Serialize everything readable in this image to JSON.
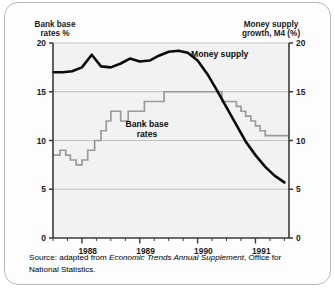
{
  "card": {
    "background_color": "#fdfdfd",
    "border_color": "#b9b9b9"
  },
  "axes": {
    "left_title_line1": "Bank base",
    "left_title_line2": "rates %",
    "right_title_line1": "Money supply",
    "right_title_line2": "growth, M4 (%)",
    "left_ticks": [
      "0",
      "5",
      "10",
      "15",
      "20"
    ],
    "right_ticks": [
      "0",
      "5",
      "10",
      "15",
      "20"
    ],
    "year_labels": [
      "1988",
      "1989",
      "1990",
      "1991"
    ]
  },
  "series_labels": {
    "money_supply": "Money supply",
    "bank_base_line1": "Bank base",
    "bank_base_line2": "rates"
  },
  "source": {
    "prefix": "Source: adapted from ",
    "italic_title": "Economic Trends Annual Supplement",
    "suffix": ", Office for",
    "line2": "National Statistics."
  },
  "chart_data": {
    "type": "line",
    "title": "",
    "xlabel": "",
    "ylabel": "Bank base rates %",
    "y2label": "Money supply growth, M4 (%)",
    "ylim": [
      0,
      20
    ],
    "y2lim": [
      0,
      20
    ],
    "xlim": [
      1987.5,
      1991.58
    ],
    "yticks": [
      0,
      5,
      10,
      15,
      20
    ],
    "y2ticks": [
      0,
      5,
      10,
      15,
      20
    ],
    "xticks": [
      1988,
      1989,
      1990,
      1991
    ],
    "xtick_minor_step": 0.25,
    "grid": "horizontal",
    "legend": "inline-annotations",
    "series": [
      {
        "name": "Money supply growth, M4 (%)",
        "axis": "right",
        "style": "smooth-thick-black",
        "color": "#0b0b0b",
        "x": [
          1987.5,
          1987.67,
          1987.83,
          1988.0,
          1988.17,
          1988.33,
          1988.5,
          1988.67,
          1988.83,
          1989.0,
          1989.17,
          1989.33,
          1989.5,
          1989.67,
          1989.83,
          1990.0,
          1990.17,
          1990.33,
          1990.5,
          1990.67,
          1990.83,
          1991.0,
          1991.17,
          1991.33,
          1991.5
        ],
        "values": [
          17.0,
          17.0,
          17.1,
          17.5,
          18.8,
          17.6,
          17.5,
          17.9,
          18.4,
          18.1,
          18.2,
          18.7,
          19.1,
          19.2,
          19.0,
          18.2,
          16.8,
          15.2,
          13.4,
          11.6,
          9.9,
          8.5,
          7.3,
          6.4,
          5.7
        ]
      },
      {
        "name": "Bank base rates %",
        "axis": "left",
        "style": "step-grey",
        "color": "#9a9a9a",
        "x": [
          1987.5,
          1987.62,
          1987.72,
          1987.8,
          1987.9,
          1988.0,
          1988.1,
          1988.22,
          1988.33,
          1988.42,
          1988.5,
          1988.58,
          1988.67,
          1988.8,
          1988.92,
          1989.08,
          1989.25,
          1989.42,
          1989.5,
          1990.33,
          1990.42,
          1990.58,
          1990.67,
          1990.75,
          1990.83,
          1990.92,
          1991.0,
          1991.08,
          1991.17,
          1991.58
        ],
        "values": [
          8.5,
          9.0,
          8.5,
          8.0,
          7.5,
          8.0,
          9.0,
          10.0,
          11.0,
          12.0,
          13.0,
          13.0,
          12.0,
          13.0,
          13.0,
          14.0,
          14.0,
          15.0,
          15.0,
          15.0,
          14.0,
          14.0,
          13.5,
          13.0,
          12.5,
          12.0,
          11.5,
          11.0,
          10.5,
          10.5
        ]
      }
    ],
    "annotations": [
      {
        "text": "Money supply",
        "x": 1990.0,
        "y": 19.0,
        "axis": "right"
      },
      {
        "text": "Bank base rates",
        "x": 1989.1,
        "y": 12.2,
        "axis": "left"
      }
    ]
  }
}
